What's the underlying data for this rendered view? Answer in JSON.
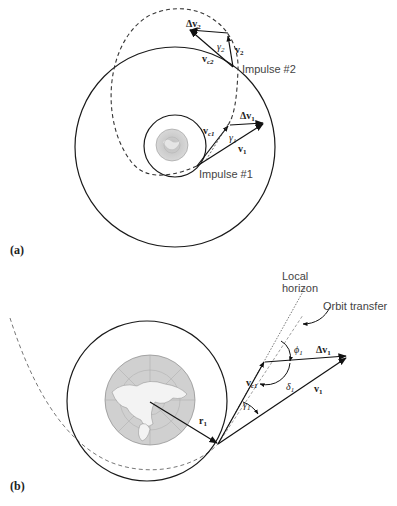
{
  "figure": {
    "panel_a": {
      "label": "(a)",
      "impulse1_label": "Impulse #1",
      "impulse2_label": "Impulse #2",
      "vectors": {
        "dv1": "Δv",
        "dv1_sub": "1",
        "v1": "v",
        "v1_sub": "1",
        "vc1": "v",
        "vc1_sub": "c1",
        "gamma1": "γ",
        "gamma1_sub": "1",
        "dv2": "Δv",
        "dv2_sub": "2",
        "v2": "v",
        "v2_sub": "2",
        "vc2": "v",
        "vc2_sub": "c2",
        "gamma2": "γ",
        "gamma2_sub": "2"
      }
    },
    "panel_b": {
      "label": "(b)",
      "local_horizon_line1": "Local",
      "local_horizon_line2": "horizon",
      "orbit_transfer_label": "Orbit transfer",
      "vectors": {
        "r1": "r",
        "r1_sub": "1",
        "vc1": "v",
        "vc1_sub": "c1",
        "v1": "v",
        "v1_sub": "1",
        "dv1": "Δv",
        "dv1_sub": "1",
        "phi1": "ϕ",
        "phi1_sub": "1",
        "delta1": "δ",
        "delta1_sub": "1",
        "gamma1": "γ",
        "gamma1_sub": "1"
      }
    },
    "colors": {
      "line": "#1a1a1a",
      "dashed": "#333333",
      "earth_fill": "#d4d4d4",
      "earth_grid": "#a8a8a8",
      "land": "#f2f2f2",
      "label": "#444444"
    }
  }
}
